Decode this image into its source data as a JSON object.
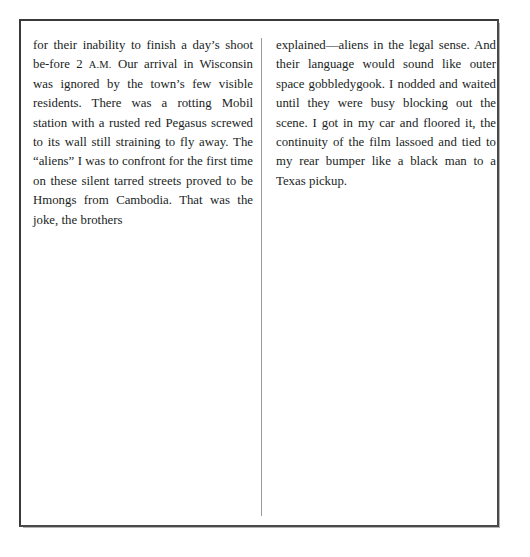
{
  "document": {
    "kind": "scanned-book-page",
    "frame": {
      "border_color": "#3a3a3a",
      "secondary_rule_color": "#b4b4b4"
    },
    "divider": {
      "color": "#9a9a9a"
    },
    "text_color": "#201e1d"
  },
  "columns": {
    "left": {
      "paragraph_part_1": "for their inability to finish a day’s shoot be-fore 2 ",
      "smallcaps": "A.M.",
      "paragraph_part_2": " Our arrival in Wisconsin was ignored by the town’s few visible residents. There was a rotting Mobil station with a rusted red Pegasus screwed to its wall still straining to fly away. The “aliens” I was to confront for the first time on these silent tarred streets proved to be Hmongs from Cambodia. That was the joke, the brothers"
    },
    "right": {
      "paragraph": "explained—aliens in the legal sense. And their language would sound like outer space gobbledygook. I nodded and waited until they were busy blocking out the scene. I got in my car and floored it, the continuity of the film lassoed and tied to my rear bumper like a black man to a Texas pickup."
    }
  }
}
